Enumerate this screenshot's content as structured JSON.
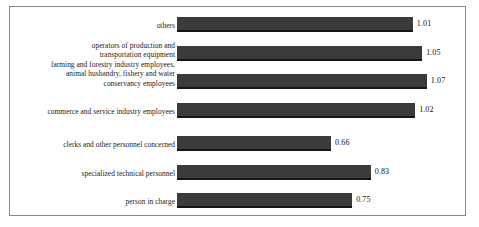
{
  "chart_data": {
    "type": "bar",
    "orientation": "horizontal",
    "title": "",
    "subtitle": "",
    "xlabel": "",
    "ylabel": "",
    "grid": false,
    "legend": null,
    "xlim": [
      0,
      1.2
    ],
    "axis_visible": false,
    "tick_labels": [],
    "bar_color": "#3b3b3b",
    "bar_edge_color": "#161616",
    "border_color": "#8a8a8a",
    "background_color": "#ffffff",
    "text_color": "#1a1a1a",
    "categories": [
      "others",
      "operators of production and\ntransportation equipment",
      "farming and forestry industry employees,\nanimal husbandry, fishery and water\nconservancy employees",
      "commerce and service industry employees",
      "clerks and other personnel concerned",
      "specialized technical personnel",
      "person in charge"
    ],
    "values": [
      1.01,
      1.05,
      1.07,
      1.02,
      0.66,
      0.83,
      0.75
    ],
    "value_labels": [
      "1.01",
      "1.05",
      "1.07",
      "1.02",
      "0.66",
      "0.83",
      "0.75"
    ]
  }
}
